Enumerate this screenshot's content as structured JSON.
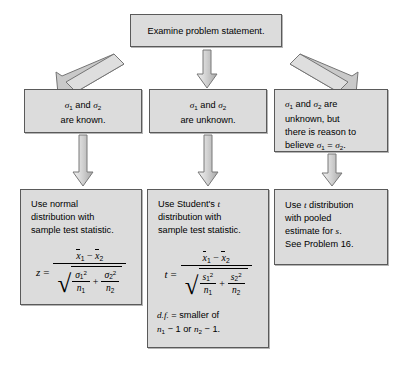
{
  "diagram": {
    "type": "flowchart",
    "colors": {
      "box_fill": "#dcdcdc",
      "box_border": "#5a5a5a",
      "arrow_fill": "#c8c8c8",
      "arrow_border": "#6e6e6e",
      "background": "#ffffff",
      "text": "#000000"
    },
    "nodes": {
      "start": {
        "label": "Examine problem statement.",
        "lines": [
          "Examine problem statement."
        ]
      },
      "cond_left": {
        "lines_html": [
          "<span class='sig'>σ</span><sub>1</sub> and <span class='sig'>σ</span><sub>2</sub>",
          "are known."
        ],
        "text": "σ1 and σ2 are known."
      },
      "cond_mid": {
        "lines_html": [
          "<span class='sig'>σ</span><sub>1</sub> and <span class='sig'>σ</span><sub>2</sub>",
          "are unknown."
        ],
        "text": "σ1 and σ2 are unknown."
      },
      "cond_right": {
        "lines_html": [
          "<span class='sig'>σ</span><sub>1</sub> and <span class='sig'>σ</span><sub>2</sub> are",
          "unknown, but",
          "there is reason to",
          "believe <span class='sig'>σ</span><sub>1</sub> = <span class='sig'>σ</span><sub>2</sub>."
        ],
        "text": "σ1 and σ2 are unknown, but there is reason to believe σ1 = σ2."
      },
      "result_left": {
        "lines_html": [
          "Use normal",
          "distribution with",
          "sample test statistic."
        ],
        "text": "Use normal distribution with sample test statistic.",
        "formula_text": "z = (x̄1 − x̄2) / √(σ²₁/n₁ + σ²₂/n₂)",
        "formula": {
          "lhs": "z",
          "eq": "=",
          "numerator": "x̄1 − x̄2",
          "denominator": "√(σ₁²/n₁ + σ₂²/n₂)",
          "variance_symbol": "σ"
        }
      },
      "result_mid": {
        "lines_html": [
          "Use Student's <i class='m'>t</i>",
          "distribution with",
          "sample test statistic."
        ],
        "text": "Use Student's t distribution with sample test statistic.",
        "formula_text": "t = (x̄1 − x̄2) / √(s²₁/n₁ + s²₂/n₂)",
        "formula": {
          "lhs": "t",
          "eq": "=",
          "numerator": "x̄1 − x̄2",
          "denominator": "√(s₁²/n₁ + s₂²/n₂)",
          "variance_symbol": "s"
        },
        "df_lines_html": [
          "<i class='m'>d.f.</i> = smaller of",
          "<i class='m'>n</i><sub>1</sub> − 1 or <i class='m'>n</i><sub>2</sub> − 1."
        ],
        "df_text": "d.f. = smaller of n1 − 1 or n2 − 1."
      },
      "result_right": {
        "lines_html": [
          "Use <i class='m'>t</i> distribution",
          "with pooled",
          "estimate for <i class='m'>s</i>.",
          "See Problem 16."
        ],
        "text": "Use t distribution with pooled estimate for s. See Problem 16."
      }
    },
    "arrows": [
      {
        "name": "arrow-start-to-left",
        "kind": "diagonal-down-left"
      },
      {
        "name": "arrow-start-to-mid",
        "kind": "vertical-down"
      },
      {
        "name": "arrow-start-to-right",
        "kind": "diagonal-down-right"
      },
      {
        "name": "arrow-left-cond-to-result",
        "kind": "vertical-down"
      },
      {
        "name": "arrow-mid-cond-to-result",
        "kind": "vertical-down"
      },
      {
        "name": "arrow-right-cond-to-result",
        "kind": "vertical-down"
      }
    ]
  }
}
